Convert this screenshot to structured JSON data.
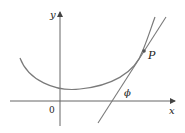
{
  "figure": {
    "axes": {
      "x_label": "x",
      "y_label": "y",
      "origin_label": "0"
    },
    "point_label": "P",
    "angle_label": "ϕ",
    "colors": {
      "curve": "#7a7a7a",
      "axes": "#555555",
      "text": "#222222"
    }
  }
}
